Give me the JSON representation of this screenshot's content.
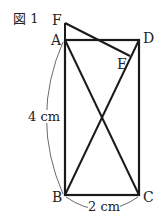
{
  "figure": {
    "caption": "図 1",
    "points": {
      "A": {
        "label": "A",
        "x": 65,
        "y": 40
      },
      "B": {
        "label": "B",
        "x": 65,
        "y": 195
      },
      "C": {
        "label": "C",
        "x": 139,
        "y": 195
      },
      "D": {
        "label": "D",
        "x": 139,
        "y": 40
      },
      "E": {
        "label": "E",
        "x": 130,
        "y": 56
      },
      "F": {
        "label": "F",
        "x": 65,
        "y": 23
      }
    },
    "dimensions": {
      "height_label": "4 cm",
      "width_label": "2 cm"
    }
  }
}
